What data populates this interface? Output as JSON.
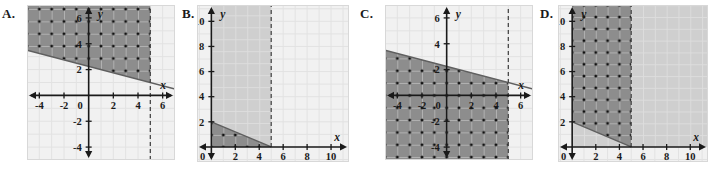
{
  "figure": {
    "type": "multi-panel-graph-choices",
    "panels": [
      {
        "id": "A",
        "label": "A.",
        "axis_label_x": "x",
        "axis_label_y": "y",
        "x_range": [
          -5,
          7
        ],
        "y_range": [
          -5,
          7
        ],
        "x_ticks": [
          -4,
          -2,
          2,
          4,
          6
        ],
        "y_ticks": [
          -4,
          -2,
          2,
          4,
          6
        ],
        "origin_label": "0",
        "x_tick_labels": [
          "-4",
          "-2",
          "2",
          "4",
          "6"
        ],
        "y_tick_labels": [
          "-4",
          "-2",
          "2",
          "4",
          "6"
        ],
        "boundary_line": {
          "kind": "solid-diagonal",
          "from": [
            -5,
            3.5
          ],
          "to": [
            7,
            0.5
          ],
          "slope": -0.25,
          "intercept": 2.25
        },
        "dashed_vertical_x": 5,
        "shaded_description": "region above diagonal line and left of dashed vertical line x=5, dark gray with lattice dots",
        "light_shaded_description": "none"
      },
      {
        "id": "B",
        "label": "B.",
        "axis_label_x": "x",
        "axis_label_y": "y",
        "x_range": [
          -1.2,
          11.5
        ],
        "y_range": [
          -1.2,
          11.3
        ],
        "x_ticks": [
          2,
          4,
          6,
          8,
          10
        ],
        "y_ticks": [
          2,
          4,
          6,
          8,
          10
        ],
        "origin_label": "0",
        "x_tick_labels": [
          "2",
          "4",
          "6",
          "8",
          "10"
        ],
        "y_tick_labels": [
          "2",
          "4",
          "6",
          "8",
          "10"
        ],
        "boundary_line": {
          "kind": "solid-diagonal",
          "from": [
            0,
            2
          ],
          "to": [
            5,
            0
          ],
          "slope": -0.4,
          "intercept": 2
        },
        "dashed_vertical_x": 5,
        "shaded_description": "dark gray triangle below line from (0,2) to (5,0) in first quadrant with lattice dots",
        "light_shaded_description": "light gray band from x=0 to dashed line x=5 above the diagonal"
      },
      {
        "id": "C",
        "label": "C.",
        "axis_label_x": "x",
        "axis_label_y": "y",
        "x_range": [
          -5,
          7
        ],
        "y_range": [
          -5,
          7
        ],
        "x_ticks": [
          -4,
          -2,
          2,
          4,
          6
        ],
        "y_ticks": [
          -4,
          -2,
          2,
          4,
          6
        ],
        "origin_label": "0",
        "x_tick_labels": [
          "-4",
          "-2",
          "2",
          "4",
          "6"
        ],
        "y_tick_labels": [
          "-4",
          "-2",
          "2",
          "4",
          "6"
        ],
        "boundary_line": {
          "kind": "solid-diagonal",
          "from": [
            -5,
            3.5
          ],
          "to": [
            7,
            0.5
          ],
          "slope": -0.25,
          "intercept": 2.25
        },
        "dashed_vertical_x": 5,
        "shaded_description": "region below diagonal line and left of dashed vertical line x=5, dark gray with lattice dots",
        "light_shaded_description": "none"
      },
      {
        "id": "D",
        "label": "D.",
        "axis_label_x": "x",
        "axis_label_y": "y",
        "x_range": [
          -1.2,
          11.5
        ],
        "y_range": [
          -1.2,
          11.3
        ],
        "x_ticks": [
          2,
          4,
          6,
          8,
          10
        ],
        "y_ticks": [
          2,
          4,
          6,
          8,
          10
        ],
        "origin_label": "0",
        "x_tick_labels": [
          "2",
          "4",
          "6",
          "8",
          "10"
        ],
        "y_tick_labels": [
          "2",
          "4",
          "6",
          "8",
          "10"
        ],
        "boundary_line": {
          "kind": "solid-diagonal",
          "from": [
            0,
            2
          ],
          "to": [
            5,
            0
          ],
          "slope": -0.4,
          "intercept": 2
        },
        "dashed_vertical_x": 5,
        "shaded_description": "dark gray band from x=0 to x=5 above the diagonal line with lattice dots",
        "light_shaded_description": "light gray region to the right of x=5 and below the diagonal"
      }
    ]
  },
  "chart_data": {
    "type": "scatter",
    "title": "",
    "xlabel": "x",
    "ylabel": "y",
    "grid": true,
    "legend": "none",
    "panels": [
      {
        "name": "A",
        "xlim": [
          -5,
          7
        ],
        "ylim": [
          -5,
          7
        ],
        "xticks": [
          -4,
          -2,
          0,
          2,
          4,
          6
        ],
        "yticks": [
          -4,
          -2,
          0,
          2,
          4,
          6
        ],
        "lines": [
          {
            "name": "diagonal boundary",
            "style": "solid",
            "points": [
              [
                -5,
                3.5
              ],
              [
                7,
                0.5
              ]
            ]
          },
          {
            "name": "vertical boundary",
            "style": "dashed",
            "points": [
              [
                5,
                -5
              ],
              [
                5,
                7
              ]
            ]
          }
        ],
        "shaded_regions": [
          {
            "name": "solution",
            "fill": "dark",
            "dots": true,
            "condition": "y >= -0.25x + 2.25 AND x < 5"
          }
        ]
      },
      {
        "name": "B",
        "xlim": [
          -1.2,
          11.5
        ],
        "ylim": [
          -1.2,
          11.3
        ],
        "xticks": [
          0,
          2,
          4,
          6,
          8,
          10
        ],
        "yticks": [
          0,
          2,
          4,
          6,
          8,
          10
        ],
        "lines": [
          {
            "name": "diagonal boundary",
            "style": "solid",
            "points": [
              [
                0,
                2
              ],
              [
                5,
                0
              ]
            ]
          },
          {
            "name": "vertical boundary",
            "style": "dashed",
            "points": [
              [
                5,
                0
              ],
              [
                5,
                11.3
              ]
            ]
          }
        ],
        "shaded_regions": [
          {
            "name": "solution",
            "fill": "dark",
            "dots": true,
            "condition": "0 <= y <= -0.4x + 2 AND 0 <= x <= 5"
          },
          {
            "name": "secondary",
            "fill": "light",
            "dots": false,
            "condition": "y >= -0.4x + 2 AND 0 <= x <= 5"
          }
        ]
      },
      {
        "name": "C",
        "xlim": [
          -5,
          7
        ],
        "ylim": [
          -5,
          7
        ],
        "xticks": [
          -4,
          -2,
          0,
          2,
          4,
          6
        ],
        "yticks": [
          -4,
          -2,
          0,
          2,
          4,
          6
        ],
        "lines": [
          {
            "name": "diagonal boundary",
            "style": "solid",
            "points": [
              [
                -5,
                3.5
              ],
              [
                7,
                0.5
              ]
            ]
          },
          {
            "name": "vertical boundary",
            "style": "dashed",
            "points": [
              [
                5,
                -5
              ],
              [
                5,
                7
              ]
            ]
          }
        ],
        "shaded_regions": [
          {
            "name": "solution",
            "fill": "dark",
            "dots": true,
            "condition": "y <= -0.25x + 2.25 AND x < 5"
          }
        ]
      },
      {
        "name": "D",
        "xlim": [
          -1.2,
          11.5
        ],
        "ylim": [
          -1.2,
          11.3
        ],
        "xticks": [
          0,
          2,
          4,
          6,
          8,
          10
        ],
        "yticks": [
          0,
          2,
          4,
          6,
          8,
          10
        ],
        "lines": [
          {
            "name": "diagonal boundary",
            "style": "solid",
            "points": [
              [
                0,
                2
              ],
              [
                5,
                0
              ]
            ]
          },
          {
            "name": "vertical boundary",
            "style": "dashed",
            "points": [
              [
                5,
                0
              ],
              [
                5,
                11.3
              ]
            ]
          }
        ],
        "shaded_regions": [
          {
            "name": "solution",
            "fill": "dark",
            "dots": true,
            "condition": "y >= -0.4x + 2 AND 0 <= x <= 5"
          },
          {
            "name": "secondary",
            "fill": "light",
            "dots": false,
            "condition": "x >= 5 OR y <= -0.4x + 2"
          }
        ]
      }
    ]
  },
  "colors": {
    "dark_fill": "#8d8d8d",
    "light_fill": "#cfcfcf",
    "plot_background": "#f1f1f1",
    "grid_line": "#e2e2e2",
    "axis": "#1a1a1a",
    "dot": "#111111",
    "label_text": "#1a1a1a"
  }
}
